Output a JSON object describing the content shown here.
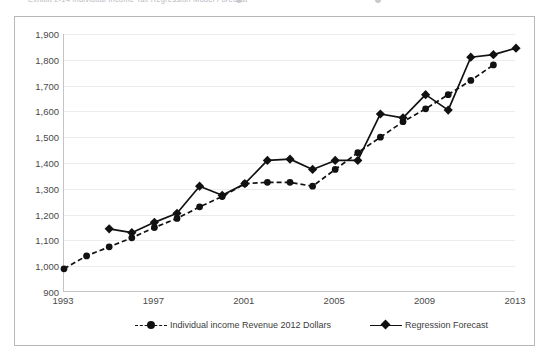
{
  "ghost_header": {
    "text": "Exhibit 2-14        Individual Income Tax Regression Model Forecast",
    "visible_hint": "clipped-partial-row"
  },
  "axes": {
    "y_ticks": [
      "1,900",
      "1,800",
      "1,700",
      "1,600",
      "1,500",
      "1,400",
      "1,300",
      "1,200",
      "1,100",
      "1,000",
      "900"
    ],
    "y_values": [
      1900,
      1800,
      1700,
      1600,
      1500,
      1400,
      1300,
      1200,
      1100,
      1000,
      900
    ],
    "x_ticks": [
      "1993",
      "1997",
      "2001",
      "2005",
      "2009",
      "2013"
    ],
    "x_values": [
      1993,
      1997,
      2001,
      2005,
      2009,
      2013
    ]
  },
  "legend": {
    "items": [
      {
        "label": "Individual income Revenue 2012 Dollars",
        "marker": "circle-marker-icon",
        "line": "dashed",
        "color": "#111111"
      },
      {
        "label": "Regression Forecast",
        "marker": "diamond-marker-icon",
        "line": "solid",
        "color": "#111111"
      }
    ]
  },
  "chart_data": {
    "type": "line",
    "title": "",
    "subtitle": "",
    "xlabel": "",
    "ylabel": "",
    "xlim": [
      1993,
      2013
    ],
    "ylim": [
      900,
      1900
    ],
    "xticks": [
      1993,
      1997,
      2001,
      2005,
      2009,
      2013
    ],
    "yticks": [
      900,
      1000,
      1100,
      1200,
      1300,
      1400,
      1500,
      1600,
      1700,
      1800,
      1900
    ],
    "grid": "horizontal",
    "legend_position": "bottom",
    "series": [
      {
        "name": "Individual income Revenue 2012 Dollars",
        "marker": "circle",
        "linestyle": "dashed",
        "color": "#111111",
        "x": [
          1993,
          1994,
          1995,
          1996,
          1997,
          1998,
          1999,
          2000,
          2001,
          2002,
          2003,
          2004,
          2005,
          2006,
          2007,
          2008,
          2009,
          2010,
          2011,
          2012
        ],
        "values": [
          990,
          1040,
          1075,
          1110,
          1150,
          1185,
          1230,
          1270,
          1320,
          1325,
          1325,
          1310,
          1375,
          1440,
          1500,
          1560,
          1610,
          1665,
          1720,
          1780
        ]
      },
      {
        "name": "Regression Forecast",
        "marker": "diamond",
        "linestyle": "solid",
        "color": "#111111",
        "x": [
          1995,
          1996,
          1997,
          1998,
          1999,
          2000,
          2001,
          2002,
          2003,
          2004,
          2005,
          2006,
          2007,
          2008,
          2009,
          2010,
          2011,
          2012,
          2013
        ],
        "values": [
          1145,
          1130,
          1170,
          1205,
          1310,
          1275,
          1320,
          1410,
          1415,
          1375,
          1410,
          1410,
          1590,
          1575,
          1665,
          1605,
          1810,
          1820,
          1845
        ]
      }
    ]
  }
}
